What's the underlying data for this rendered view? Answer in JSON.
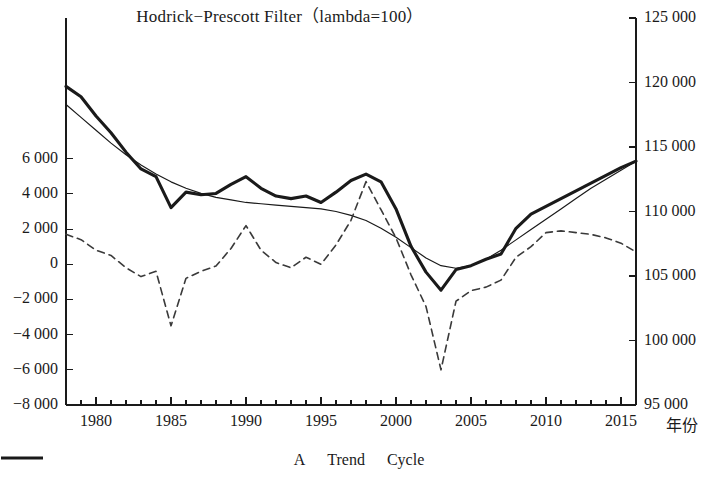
{
  "chart_data": {
    "type": "line",
    "title": "Hodrick−Prescott Filter（lambda=100）",
    "xlabel": "年份",
    "ylabel_left": "",
    "ylabel_right": "",
    "xlim": [
      1978,
      2016
    ],
    "ylim_left": [
      -8000,
      14000
    ],
    "ylim_right": [
      95000,
      125000
    ],
    "grid": false,
    "legend_position": "bottom",
    "x_ticks": [
      1980,
      1985,
      1990,
      1995,
      2000,
      2005,
      2010,
      2015
    ],
    "x_tick_labels": [
      "1980",
      "1985",
      "1990",
      "1995",
      "2000",
      "2005",
      "2010",
      "2015"
    ],
    "y_left_ticks": [
      6000,
      4000,
      2000,
      0,
      -2000,
      -4000,
      -6000,
      -8000
    ],
    "y_left_tick_labels": [
      "6 000",
      "4 000",
      "2 000",
      "0",
      "−2 000",
      "−4 000",
      "−6 000",
      "−8 000"
    ],
    "y_right_ticks": [
      125000,
      120000,
      115000,
      110000,
      105000,
      100000,
      95000
    ],
    "y_right_tick_labels": [
      "125 000",
      "120 000",
      "115 000",
      "110 000",
      "105 000",
      "100 000",
      "95 000"
    ],
    "x": [
      1978,
      1979,
      1980,
      1981,
      1982,
      1983,
      1984,
      1985,
      1986,
      1987,
      1988,
      1989,
      1990,
      1991,
      1992,
      1993,
      1994,
      1995,
      1996,
      1997,
      1998,
      1999,
      2000,
      2001,
      2002,
      2003,
      2004,
      2005,
      2006,
      2007,
      2008,
      2009,
      2010,
      2011,
      2012,
      2013,
      2014,
      2015,
      2016
    ],
    "series": [
      {
        "name": "A",
        "axis": "right",
        "style": "solid-thick",
        "color": "#1a1a1a",
        "values": [
          119700,
          118900,
          117400,
          116100,
          114600,
          113300,
          112700,
          110300,
          111500,
          111300,
          111400,
          112100,
          112700,
          111800,
          111200,
          111000,
          111200,
          110700,
          111500,
          112400,
          112900,
          112300,
          110200,
          107300,
          105300,
          103900,
          105500,
          105800,
          106300,
          106700,
          108700,
          109800,
          110400,
          111000,
          111600,
          112200,
          112800,
          113400,
          113900
        ]
      },
      {
        "name": "Trend",
        "axis": "right",
        "style": "solid-thin",
        "color": "#1a1a1a",
        "values": [
          118300,
          117300,
          116300,
          115300,
          114400,
          113600,
          112900,
          112300,
          111800,
          111400,
          111100,
          110900,
          110700,
          110600,
          110500,
          110400,
          110300,
          110200,
          110000,
          109700,
          109300,
          108700,
          108000,
          107200,
          106400,
          105800,
          105600,
          105800,
          106300,
          107000,
          107800,
          108600,
          109400,
          110200,
          111000,
          111800,
          112500,
          113200,
          113900
        ]
      },
      {
        "name": "Cycle",
        "axis": "left",
        "style": "dashed",
        "color": "#3a3a3a",
        "values": [
          1700,
          1400,
          800,
          500,
          -200,
          -700,
          -400,
          -3500,
          -800,
          -400,
          -100,
          900,
          2200,
          800,
          100,
          -200,
          400,
          0,
          1100,
          2500,
          4700,
          3100,
          1500,
          -600,
          -2400,
          -6000,
          -2100,
          -1500,
          -1300,
          -900,
          400,
          1000,
          1800,
          1900,
          1800,
          1700,
          1500,
          1200,
          700
        ]
      }
    ]
  },
  "legend": {
    "items": [
      {
        "label": "A",
        "swatch": "solid-thick"
      },
      {
        "label": "Trend",
        "swatch": "solid-thin"
      },
      {
        "label": "Cycle",
        "swatch": "dashed"
      }
    ]
  }
}
